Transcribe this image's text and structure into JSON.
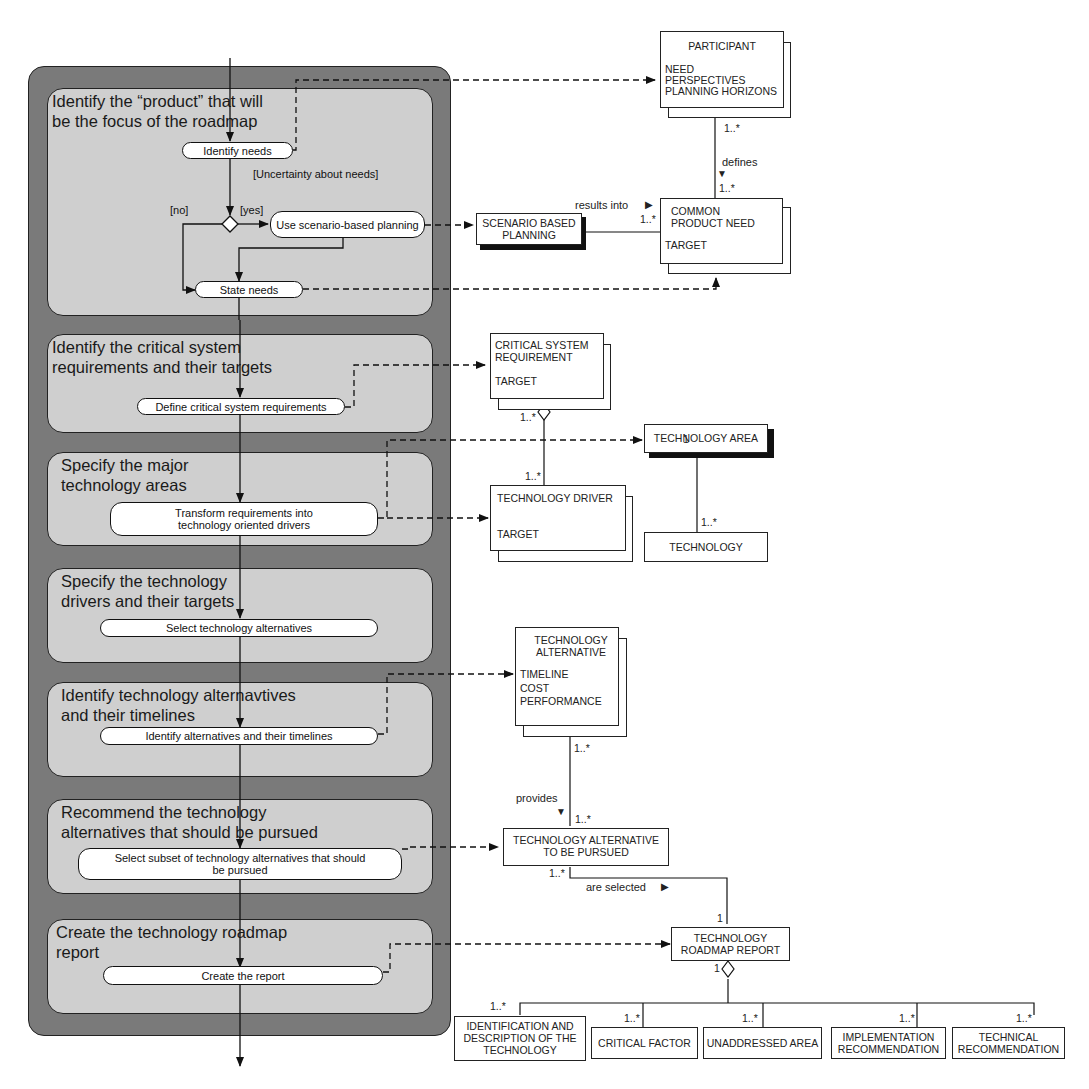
{
  "activity_diagram": {
    "swimlanes": [
      {
        "title": "Identify the “product” that will\nbe the focus of the roadmap"
      },
      {
        "title": "Identify the critical system\nrequirements and their targets"
      },
      {
        "title": "Specify the major\ntechnology areas"
      },
      {
        "title": "Specify the technology\ndrivers and their targets"
      },
      {
        "title": "Identify technology alternavtives\nand their timelines"
      },
      {
        "title": "Recommend the technology\nalternatives that should be pursued"
      },
      {
        "title": "Create the technology roadmap\nreport"
      }
    ],
    "activities": {
      "identify_needs": "Identify needs",
      "use_scenario": "Use scenario-based planning",
      "state_needs": "State needs",
      "define_requirements": "Define critical system requirements",
      "transform_requirements": "Transform requirements into technology oriented drivers",
      "select_alternatives": "Select technology alternatives",
      "identify_alternatives": "Identify alternatives and their timelines",
      "select_subset": "Select subset of technology alternatives that should be pursued",
      "create_report": "Create the report"
    },
    "guards": {
      "uncertainty": "[Uncertainty about needs]",
      "no": "[no]",
      "yes": "[yes]"
    }
  },
  "class_diagram": {
    "participant": {
      "name": "PARTICIPANT",
      "attributes": "NEED\nPERSPECTIVES\nPLANNING HORIZONS"
    },
    "common_product_need": {
      "name": "COMMON\nPRODUCT NEED",
      "attributes": "TARGET"
    },
    "scenario_based_planning": {
      "name": "SCENARIO BASED\nPLANNING"
    },
    "critical_system_requirement": {
      "name": "CRITICAL SYSTEM\nREQUIREMENT",
      "attributes": "TARGET"
    },
    "technology_area": {
      "name": "TECHNOLOGY AREA"
    },
    "technology_driver": {
      "name": "TECHNOLOGY DRIVER",
      "attributes": "TARGET"
    },
    "technology": {
      "name": "TECHNOLOGY"
    },
    "technology_alternative": {
      "name": "TECHNOLOGY\nALTERNATIVE",
      "attributes": "TIMELINE\nCOST\nPERFORMANCE"
    },
    "technology_alternative_pursued": {
      "name": "TECHNOLOGY ALTERNATIVE\nTO BE PURSUED"
    },
    "technology_roadmap_report": {
      "name": "TECHNOLOGY\nROADMAP REPORT"
    },
    "report_parts": [
      {
        "name": "IDENTIFICATION AND\nDESCRIPTION OF THE\nTECHNOLOGY"
      },
      {
        "name": "CRITICAL FACTOR"
      },
      {
        "name": "UNADDRESSED AREA"
      },
      {
        "name": "IMPLEMENTATION\nRECOMMENDATION"
      },
      {
        "name": "TECHNICAL\nRECOMMENDATION"
      }
    ],
    "associations": {
      "defines": "defines",
      "results_into": "results into",
      "provides": "provides",
      "are_selected": "are selected"
    },
    "multiplicities": {
      "many": "1..*",
      "one": "1"
    },
    "arrow_glyphs": {
      "right": "▶",
      "down": "▼"
    }
  }
}
